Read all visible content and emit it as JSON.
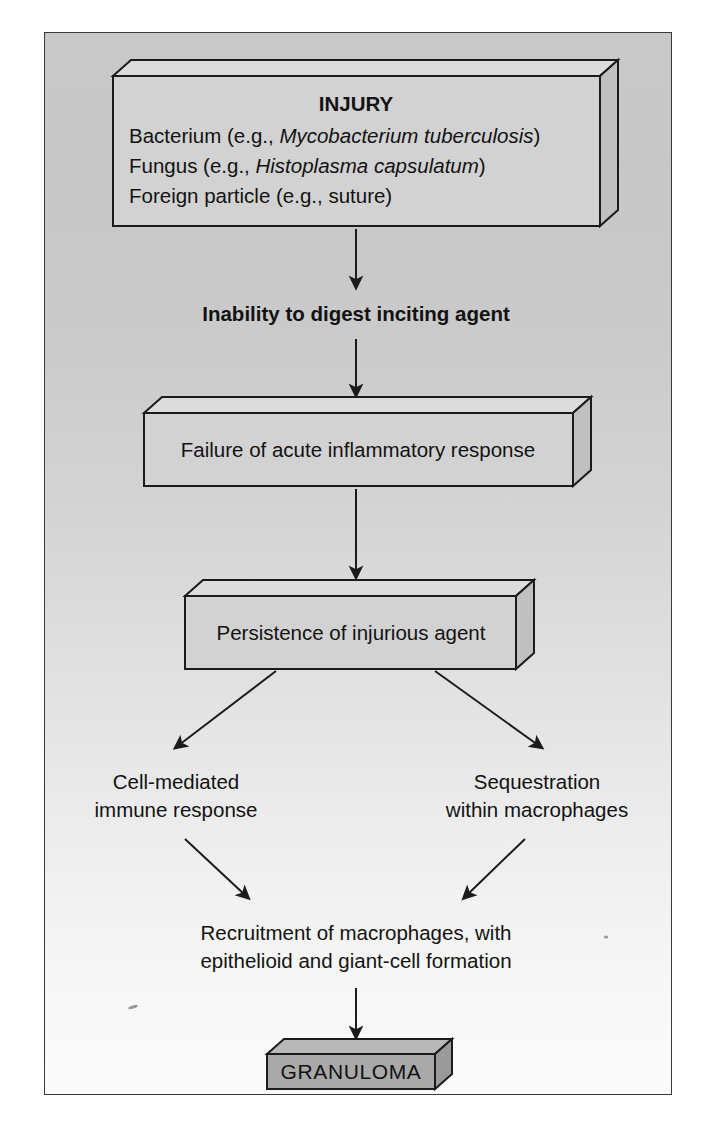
{
  "diagram": {
    "type": "flowchart",
    "background_top_color": "#c9c9c9",
    "background_bottom_color": "#fbfbfb",
    "border_color": "#3a3a3a",
    "box_fill_color": "#d2d2d2",
    "granuloma_fill_color": "#a9a9a9",
    "line_color": "#1b1b1b"
  },
  "nodes": {
    "injury": {
      "shape": "3d-box",
      "heading": "INJURY",
      "line1_pre": "Bacterium (e.g., ",
      "line1_italic": "Mycobacterium tuberculosis",
      "line1_post": ")",
      "line2_pre": "Fungus (e.g., ",
      "line2_italic": "Histoplasma capsulatum",
      "line2_post": ")",
      "line3": "Foreign particle (e.g., suture)"
    },
    "inability": {
      "shape": "plain-bold-text",
      "label": "Inability to digest inciting agent"
    },
    "failure": {
      "shape": "3d-box",
      "label": "Failure of acute inflammatory response"
    },
    "persistence": {
      "shape": "3d-box",
      "label": "Persistence of injurious agent"
    },
    "cell_mediated": {
      "shape": "plain-text",
      "line1": "Cell-mediated",
      "line2": "immune response"
    },
    "sequestration": {
      "shape": "plain-text",
      "line1": "Sequestration",
      "line2": "within macrophages"
    },
    "recruitment": {
      "shape": "plain-text",
      "line1": "Recruitment of macrophages, with",
      "line2": "epithelioid and giant-cell formation"
    },
    "granuloma": {
      "shape": "3d-box",
      "label": "GRANULOMA"
    }
  },
  "edges": [
    {
      "from": "injury",
      "to": "inability",
      "style": "straight-down"
    },
    {
      "from": "inability",
      "to": "failure",
      "style": "straight-down"
    },
    {
      "from": "failure",
      "to": "persistence",
      "style": "straight-down"
    },
    {
      "from": "persistence",
      "to": "cell_mediated",
      "style": "diagonal-left"
    },
    {
      "from": "persistence",
      "to": "sequestration",
      "style": "diagonal-right"
    },
    {
      "from": "cell_mediated",
      "to": "recruitment",
      "style": "diagonal-right"
    },
    {
      "from": "sequestration",
      "to": "recruitment",
      "style": "diagonal-left"
    },
    {
      "from": "recruitment",
      "to": "granuloma",
      "style": "straight-down"
    }
  ]
}
